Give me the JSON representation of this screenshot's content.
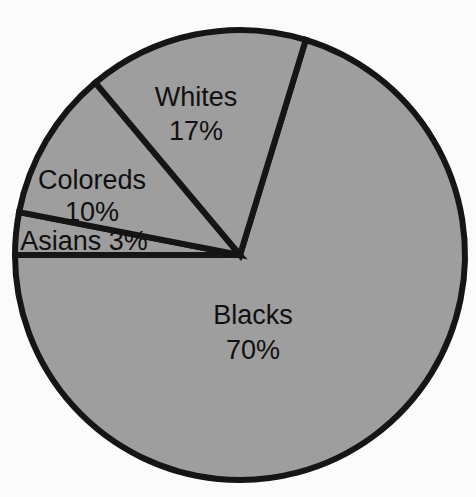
{
  "figure": {
    "background_color": "#fbfbfb",
    "type": "pie-chart-figure"
  },
  "chart_data": {
    "type": "pie",
    "title": "",
    "subtitle": "",
    "xlabel": "",
    "ylabel": "",
    "grid": false,
    "legend_position": "none",
    "labels_inside_slices": true,
    "total_percent": 100,
    "categories": [
      "Whites",
      "Coloreds",
      "Asians",
      "Blacks"
    ],
    "values": [
      17,
      10,
      3,
      70
    ],
    "slices": [
      {
        "name": "Whites",
        "label": "Whites",
        "value": 17,
        "value_label": "17%",
        "color": "#9e9e9e",
        "stroke": "#151515",
        "start_angle_deg": 73,
        "end_angle_deg": 130,
        "label_lines": [
          "Whites",
          "17%"
        ]
      },
      {
        "name": "Coloreds",
        "label": "Coloreds",
        "value": 10,
        "value_label": "10%",
        "color": "#9e9e9e",
        "stroke": "#151515",
        "start_angle_deg": 130,
        "end_angle_deg": 169,
        "label_lines": [
          "Coloreds",
          "10%"
        ]
      },
      {
        "name": "Asians",
        "label": "Asians",
        "value": 3,
        "value_label": "3%",
        "color": "#9e9e9e",
        "stroke": "#151515",
        "start_angle_deg": 169,
        "end_angle_deg": 180,
        "label_lines": [
          "Asians 3%"
        ]
      },
      {
        "name": "Blacks",
        "label": "Blacks",
        "value": 70,
        "value_label": "70%",
        "color": "#9e9e9e",
        "stroke": "#151515",
        "start_angle_deg": 180,
        "end_angle_deg": 433,
        "label_lines": [
          "Blacks",
          "70%"
        ]
      }
    ],
    "colors": {
      "slice_fill": "#9e9e9e",
      "slice_stroke": "#151515",
      "label_text": "#101010",
      "background": "#fbfbfb"
    }
  },
  "labels": {
    "whites_name": "Whites",
    "whites_pct": "17%",
    "coloreds_name": "Coloreds",
    "coloreds_pct": "10%",
    "asians_combined": "Asians 3%",
    "blacks_name": "Blacks",
    "blacks_pct": "70%"
  }
}
